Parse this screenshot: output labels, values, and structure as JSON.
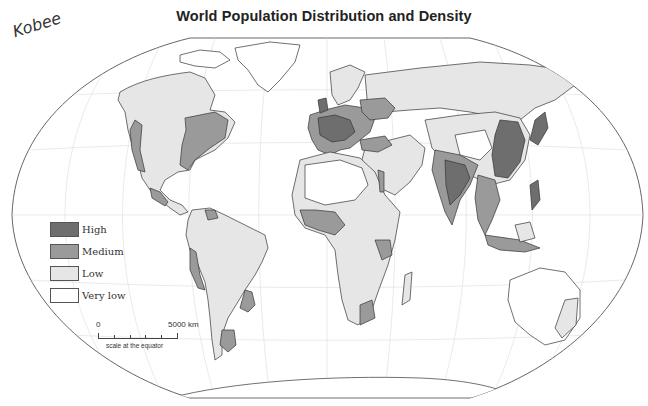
{
  "title": "World Population Distribution and Density",
  "signature": "Kobee",
  "legend": {
    "items": [
      {
        "label": "High",
        "color": "#6e6e6e"
      },
      {
        "label": "Medium",
        "color": "#9a9a9a"
      },
      {
        "label": "Low",
        "color": "#e6e6e6"
      },
      {
        "label": "Very low",
        "color": "#ffffff"
      }
    ]
  },
  "scale": {
    "zero_label": "0",
    "max_label": "5000 km",
    "caption": "scale at the equator"
  },
  "colors": {
    "high": "#6e6e6e",
    "medium": "#9a9a9a",
    "low": "#e6e6e6",
    "very_low": "#ffffff",
    "outline": "#333333",
    "graticule": "#d8d8d8"
  }
}
